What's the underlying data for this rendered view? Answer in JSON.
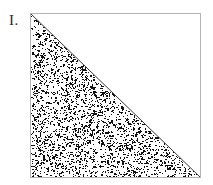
{
  "figure": {
    "label": "I.",
    "caption": "",
    "background_color": "#ffffff",
    "square": {
      "border_color": "#b4b4b4",
      "fill_color": "#ffffff",
      "x": 30,
      "y": 13,
      "width": 171,
      "height": 165
    },
    "diagonal": {
      "name": "hypotenuse",
      "color": "#3a3a3a",
      "from": "top-left",
      "to": "bottom-right",
      "stroke_width": 1
    },
    "shaded_region": {
      "name": "lower-left-triangle",
      "fill_style": "random-stipple",
      "dot_color": "#111111",
      "coverage_percent": 33,
      "dot_count": 5200,
      "seed": 20240917
    },
    "empty_region": {
      "name": "upper-right-triangle",
      "fill_style": "blank",
      "fill_color": "#ffffff"
    }
  },
  "chart_data": {
    "type": "area",
    "title": "I.",
    "xlabel": "",
    "ylabel": "",
    "xlim": [
      0,
      1
    ],
    "ylim": [
      0,
      1
    ],
    "grid": false,
    "legend": "none",
    "series": [
      {
        "name": "shaded-triangle",
        "x": [
          0,
          0,
          1
        ],
        "y": [
          1,
          0,
          0
        ],
        "fill": "stipple",
        "note": "region below the main diagonal is stippled"
      },
      {
        "name": "diagonal",
        "x": [
          0,
          1
        ],
        "y": [
          1,
          0
        ],
        "fill": "none",
        "note": "line from top-left to bottom-right"
      }
    ],
    "annotations": [
      {
        "text": "I.",
        "x": -0.14,
        "y": 1.0
      }
    ]
  }
}
